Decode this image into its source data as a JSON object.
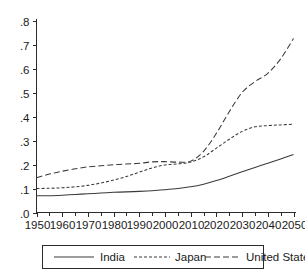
{
  "chart_data": {
    "type": "line",
    "title": "",
    "subtitle": "",
    "xlabel": "",
    "ylabel": "",
    "xlim": [
      1950,
      2050
    ],
    "ylim": [
      0.0,
      0.8
    ],
    "grid": false,
    "legend_position": "bottom",
    "x_ticks": [
      1950,
      1960,
      1970,
      1980,
      1990,
      2000,
      2010,
      2020,
      2030,
      2040,
      2050
    ],
    "x_tick_labels": [
      "1950",
      "1960",
      "1970",
      "1980",
      "1990",
      "2000",
      "2010",
      "2020",
      "2030",
      "2040",
      "2050"
    ],
    "x_minor_ticks": [
      1955,
      1965,
      1975,
      1985,
      1995,
      2005,
      2015,
      2025,
      2035,
      2045
    ],
    "y_ticks": [
      0.0,
      0.1,
      0.2,
      0.3,
      0.4,
      0.5,
      0.6,
      0.7,
      0.8
    ],
    "y_tick_labels": [
      ".0",
      ".1",
      ".2",
      ".3",
      ".4",
      ".5",
      ".6",
      ".7",
      ".8"
    ],
    "x": [
      1950,
      1955,
      1960,
      1965,
      1970,
      1975,
      1980,
      1985,
      1990,
      1995,
      2000,
      2005,
      2010,
      2015,
      2020,
      2025,
      2030,
      2035,
      2040,
      2045,
      2050
    ],
    "series": [
      {
        "name": "India",
        "dash": "solid",
        "values": [
          0.07,
          0.07,
          0.072,
          0.075,
          0.078,
          0.081,
          0.084,
          0.086,
          0.088,
          0.091,
          0.095,
          0.1,
          0.107,
          0.118,
          0.133,
          0.151,
          0.17,
          0.188,
          0.205,
          0.223,
          0.242
        ]
      },
      {
        "name": "Japan",
        "dash": "dotted",
        "values": [
          0.1,
          0.101,
          0.103,
          0.107,
          0.113,
          0.123,
          0.135,
          0.15,
          0.168,
          0.186,
          0.198,
          0.203,
          0.21,
          0.232,
          0.268,
          0.305,
          0.338,
          0.357,
          0.362,
          0.365,
          0.368
        ]
      },
      {
        "name": "United States",
        "dash": "dashed",
        "values": [
          0.145,
          0.16,
          0.172,
          0.182,
          0.19,
          0.195,
          0.199,
          0.202,
          0.205,
          0.211,
          0.212,
          0.21,
          0.214,
          0.255,
          0.33,
          0.42,
          0.5,
          0.545,
          0.58,
          0.64,
          0.725
        ]
      }
    ],
    "legend": [
      {
        "label": "India",
        "dash": "solid"
      },
      {
        "label": "Japan",
        "dash": "dotted"
      },
      {
        "label": "United States",
        "dash": "dashed"
      }
    ]
  }
}
